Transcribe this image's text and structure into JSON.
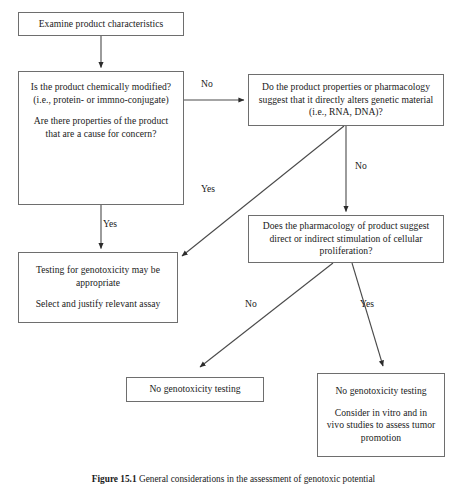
{
  "figure": {
    "caption_number": "Figure 15.1",
    "caption_text": "General considerations in the assessment of genotoxic potential"
  },
  "nodes": {
    "examine": {
      "text": "Examine product characteristics"
    },
    "chemically_modified": {
      "para1": "Is the product chemically modified? (i.e., protein- or immno-conjugate)",
      "para2": "Are there properties of the product that are a cause for concern?"
    },
    "genetic_material": {
      "text": "Do the product properties or pharmacology suggest that it directly alters genetic material (i.e., RNA, DNA)?"
    },
    "pharmacology": {
      "text": "Does the pharmacology of product suggest direct or indirect stimulation of cellular proliferation?"
    },
    "testing": {
      "para1": "Testing for genotoxicity may be appropriate",
      "para2": "Select and justify relevant assay"
    },
    "no_genotoxicity_testing_left": {
      "text": "No genotoxicity testing"
    },
    "no_genotoxicity_testing_right": {
      "para1": "No genotoxicity testing",
      "para2": "Consider in vitro and in vivo studies to assess tumor promotion"
    }
  },
  "edge_labels": {
    "chem_to_genetic": "No",
    "chem_to_testing": "Yes",
    "genetic_to_pharm": "No",
    "genetic_to_testing": "Yes",
    "pharm_to_no_left": "No",
    "pharm_to_no_right": "Yes"
  },
  "style": {
    "box_border_color": "#6e6e6e",
    "line_color": "#4a4a4a",
    "text_color": "#1a1a1a",
    "background": "#ffffff"
  }
}
